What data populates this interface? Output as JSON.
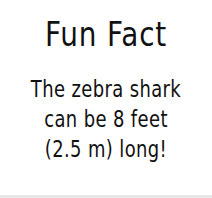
{
  "card": {
    "title": "Fun Fact",
    "lines": [
      "The zebra shark",
      "can be 8 feet",
      "(2.5 m) long!"
    ]
  },
  "colors": {
    "background": "#ffffff",
    "text": "#111111",
    "bottom_strip": "#e6e6e6"
  }
}
